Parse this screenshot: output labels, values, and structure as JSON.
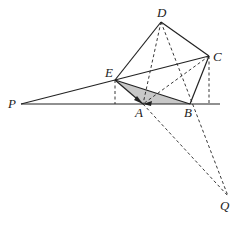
{
  "diagram": {
    "type": "geometry",
    "points": {
      "P": {
        "label": "P",
        "x": 21,
        "y": 104,
        "lx": 8,
        "ly": 108
      },
      "E": {
        "label": "E",
        "x": 115,
        "y": 80,
        "lx": 105,
        "ly": 77
      },
      "D": {
        "label": "D",
        "x": 161,
        "y": 22,
        "lx": 157,
        "ly": 17
      },
      "C": {
        "label": "C",
        "x": 209,
        "y": 56,
        "lx": 213,
        "ly": 61
      },
      "A": {
        "label": "A",
        "x": 143,
        "y": 104,
        "lx": 135,
        "ly": 117
      },
      "B": {
        "label": "B",
        "x": 190,
        "y": 104,
        "lx": 184,
        "ly": 117
      },
      "Q": {
        "label": "Q",
        "x": 228,
        "y": 196,
        "lx": 220,
        "ly": 210
      }
    },
    "baseline": {
      "x1": 21,
      "y1": 104,
      "x2": 220,
      "y2": 104
    },
    "solid_segments": [
      [
        "P",
        "C"
      ],
      [
        "E",
        "D"
      ],
      [
        "D",
        "C"
      ],
      [
        "C",
        "B"
      ],
      [
        "E",
        "B"
      ],
      [
        "E",
        "A"
      ]
    ],
    "dashed_segments": [
      [
        "D",
        "A"
      ],
      [
        "D",
        "Q"
      ],
      [
        "C",
        "A"
      ],
      [
        "A",
        "Q"
      ],
      {
        "x1": 115,
        "y1": 80,
        "x2": 115,
        "y2": 104
      },
      {
        "x1": 209,
        "y1": 56,
        "x2": 209,
        "y2": 104
      }
    ],
    "shaded_polygon": [
      "E",
      "A",
      "B"
    ],
    "colors": {
      "stroke": "#222222",
      "shade": "#c8c8c8"
    }
  }
}
